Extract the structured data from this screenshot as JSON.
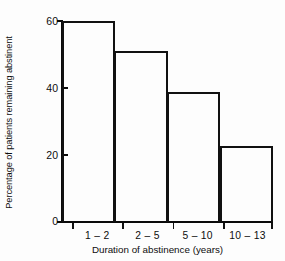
{
  "chart_data": {
    "type": "bar",
    "title": "",
    "subtitle": "",
    "categories": [
      "1 – 2",
      "2 – 5",
      "5 – 10",
      "10 – 13"
    ],
    "values": [
      60,
      51,
      38.7,
      22.5
    ],
    "xlabel": "Duration of abstinence (years)",
    "ylabel": "Percentage of patients remaining abstinent",
    "ylim": [
      0,
      60
    ],
    "yticks": [
      0,
      20,
      40,
      60
    ],
    "ytick_labels": [
      "0",
      "20",
      "40",
      "60"
    ],
    "grid": false,
    "legend": false,
    "legend_position": "none",
    "bar_style": "outline",
    "bar_edge_color": "#111111",
    "bar_fill_color": "#ffffff",
    "axis_color": "#0a0a0a",
    "background_color": "#fdfdfd",
    "annotations": []
  }
}
